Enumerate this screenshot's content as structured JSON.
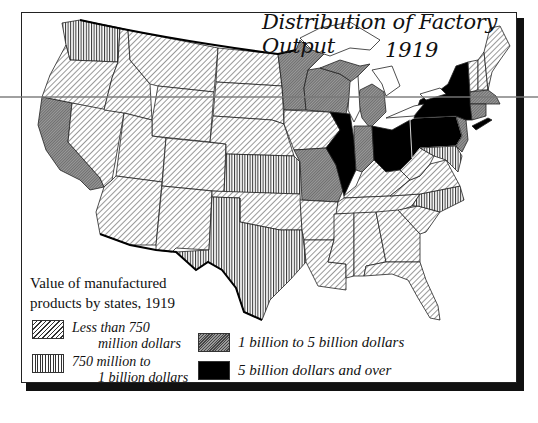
{
  "title": {
    "main": "Distribution of Factory Output",
    "year": "1919"
  },
  "legend": {
    "heading_line1": "Value of manufactured",
    "heading_line2": "products by states, 1919",
    "items": [
      {
        "line1": "Less than 750",
        "line2": "million dollars",
        "pattern": "diagonal-hatch"
      },
      {
        "line1": "750 million to",
        "line2": "1 billion dollars",
        "pattern": "vertical-hatch"
      },
      {
        "line1": "1 billion to 5 billion dollars",
        "line2": "",
        "pattern": "fine-crosshatch"
      },
      {
        "line1": "5 billion dollars and over",
        "line2": "",
        "pattern": "solid-black"
      }
    ]
  },
  "map": {
    "categories": {
      "under_750M": [
        "Oregon",
        "Idaho",
        "Montana",
        "Wyoming",
        "Nevada",
        "Utah",
        "Colorado",
        "Arizona",
        "New Mexico",
        "North Dakota",
        "South Dakota",
        "Nebraska",
        "Iowa",
        "Oklahoma",
        "Arkansas",
        "Louisiana",
        "Mississippi",
        "Alabama",
        "Georgia",
        "Florida",
        "South Carolina",
        "Tennessee",
        "Kentucky",
        "West Virginia",
        "Virginia",
        "Maine",
        "Vermont",
        "New Hampshire",
        "Delaware"
      ],
      "750M_to_1B": [
        "Washington",
        "Kansas",
        "Texas",
        "North Carolina",
        "Maryland"
      ],
      "1B_to_5B": [
        "California",
        "Minnesota",
        "Wisconsin",
        "Michigan",
        "Missouri",
        "Indiana",
        "New Jersey",
        "Massachusetts",
        "Connecticut",
        "Rhode Island"
      ],
      "over_5B": [
        "Illinois",
        "Ohio",
        "Pennsylvania",
        "New York"
      ]
    },
    "colors": {
      "ink": "#111111",
      "water": "#ffffff",
      "fine_fill": "#8a8a8a",
      "solid": "#000000"
    }
  }
}
